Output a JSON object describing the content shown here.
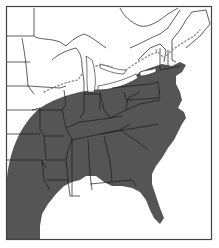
{
  "map": {
    "type": "range-map",
    "region": "Eastern United States",
    "colors": {
      "background": "#ffffff",
      "range_fill": "#555555",
      "border": "#1a1a1a",
      "frame": "#444444",
      "dotted_line": "#8a8a8a"
    },
    "frame": {
      "x": 6,
      "y": 6,
      "width": 206,
      "height": 234
    },
    "layers": [
      {
        "name": "state-borders",
        "style": "thin black lines"
      },
      {
        "name": "range-shading",
        "style": "dark gray fill over southeast and mid-Atlantic"
      },
      {
        "name": "northern-limit",
        "style": "dotted line across Great Lakes and New England"
      }
    ]
  }
}
